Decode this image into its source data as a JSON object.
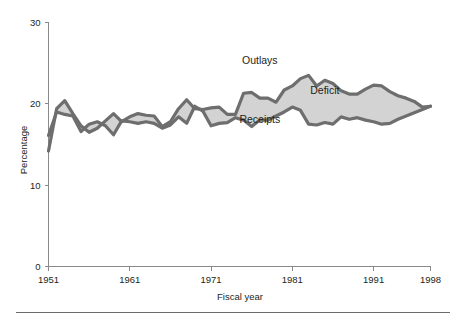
{
  "figure": {
    "background": "#ffffff",
    "band_color": "#d3d3d3",
    "line_color": "#6e6e6e",
    "axis_color": "#8a8a8a",
    "text_color": "#231f20"
  },
  "chart_data": {
    "type": "area",
    "title": "",
    "subtitle": "",
    "xlabel": "Fiscal year",
    "ylabel": "Percentage",
    "xlim": [
      1951,
      1998
    ],
    "ylim": [
      0,
      30
    ],
    "xticks": [
      1951,
      1961,
      1971,
      1981,
      1991,
      1998
    ],
    "xtick_labels": [
      "1951",
      "1961",
      "1971",
      "1981",
      "1991",
      "1998"
    ],
    "yticks": [
      0,
      10,
      20,
      30
    ],
    "ytick_labels": [
      "0",
      "10",
      "20",
      "30"
    ],
    "grid": false,
    "legend_position": "inline-annotations",
    "annotations": [
      {
        "text": "Outlays",
        "x": 1977,
        "y": 24.9
      },
      {
        "text": "Deficit",
        "x": 1985,
        "y": 21.2
      },
      {
        "text": "Receipts",
        "x": 1977,
        "y": 17.7
      }
    ],
    "fill_between": {
      "upper_series": "Outlays",
      "lower_series": "Receipts",
      "label": "Deficit",
      "color": "#d3d3d3"
    },
    "x": [
      1951,
      1952,
      1953,
      1954,
      1955,
      1956,
      1957,
      1958,
      1959,
      1960,
      1961,
      1962,
      1963,
      1964,
      1965,
      1966,
      1967,
      1968,
      1969,
      1970,
      1971,
      1972,
      1973,
      1974,
      1975,
      1976,
      1977,
      1978,
      1979,
      1980,
      1981,
      1982,
      1983,
      1984,
      1985,
      1986,
      1987,
      1988,
      1989,
      1990,
      1991,
      1992,
      1993,
      1994,
      1995,
      1996,
      1997,
      1998
    ],
    "series": [
      {
        "name": "Outlays",
        "color": "#6e6e6e",
        "values": [
          14.2,
          19.4,
          20.4,
          18.8,
          17.3,
          16.5,
          17.0,
          17.9,
          18.8,
          17.8,
          18.4,
          18.8,
          18.6,
          18.5,
          17.2,
          17.8,
          19.4,
          20.5,
          19.4,
          19.3,
          19.5,
          19.6,
          18.7,
          18.7,
          21.3,
          21.4,
          20.7,
          20.7,
          20.2,
          21.7,
          22.2,
          23.1,
          23.5,
          22.2,
          22.9,
          22.5,
          21.6,
          21.2,
          21.2,
          21.8,
          22.3,
          22.2,
          21.5,
          21.0,
          20.7,
          20.3,
          19.6,
          19.7
        ]
      },
      {
        "name": "Receipts",
        "color": "#6e6e6e",
        "values": [
          16.1,
          19.0,
          18.7,
          18.5,
          16.6,
          17.5,
          17.8,
          17.3,
          16.2,
          17.9,
          17.8,
          17.6,
          17.8,
          17.6,
          17.0,
          17.4,
          18.4,
          17.6,
          19.7,
          19.1,
          17.3,
          17.6,
          17.7,
          18.3,
          18.0,
          17.2,
          18.0,
          18.0,
          18.5,
          19.0,
          19.6,
          19.2,
          17.5,
          17.4,
          17.7,
          17.5,
          18.4,
          18.1,
          18.3,
          18.0,
          17.8,
          17.5,
          17.6,
          18.1,
          18.5,
          18.9,
          19.3,
          19.7
        ]
      }
    ]
  }
}
